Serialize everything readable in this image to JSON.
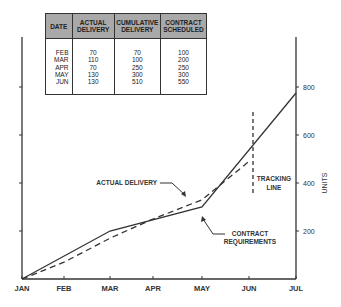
{
  "table": {
    "headers": [
      "DATE",
      "ACTUAL DELIVERY",
      "CUMULATIVE DELIVERY",
      "CONTRACT SCHEDULED"
    ],
    "rows": [
      [
        "FEB",
        "70",
        "70",
        "100"
      ],
      [
        "MAR",
        "110",
        "100",
        "200"
      ],
      [
        "APR",
        "70",
        "250",
        "250"
      ],
      [
        "MAY",
        "130",
        "300",
        "300"
      ],
      [
        "JUN",
        "130",
        "510",
        "550"
      ]
    ]
  },
  "chart_data": {
    "type": "line",
    "title": "",
    "xlabel": "",
    "ylabel": "UNITS",
    "x": [
      "JAN",
      "FEB",
      "MAR",
      "APR",
      "MAY",
      "JUN",
      "JUL"
    ],
    "ylim": [
      0,
      800
    ],
    "yticks": [
      200,
      400,
      600,
      800
    ],
    "series": [
      {
        "name": "CONTRACT REQUIREMENTS",
        "style": "solid",
        "points": [
          [
            "JAN",
            0
          ],
          [
            "MAR",
            200
          ],
          [
            "MAY",
            300
          ],
          [
            "JUL",
            775
          ]
        ]
      },
      {
        "name": "ACTUAL DELIVERY",
        "style": "dashed",
        "points": [
          [
            "JAN",
            0
          ],
          [
            "FEB",
            70
          ],
          [
            "MAR",
            170
          ],
          [
            "APR",
            250
          ],
          [
            "MAY",
            330
          ],
          [
            "JUN",
            490
          ]
        ]
      }
    ],
    "annotations": [
      {
        "text": "ACTUAL DELIVERY",
        "target": "ACTUAL DELIVERY"
      },
      {
        "text": "CONTRACT REQUIREMENTS",
        "target": "CONTRACT REQUIREMENTS"
      },
      {
        "text": "TRACKING LINE",
        "at": "JUN"
      }
    ],
    "grid": false,
    "legend": "none"
  }
}
